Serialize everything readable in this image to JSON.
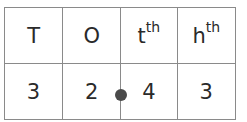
{
  "place_value_chart": {
    "headers": [
      {
        "label": "T",
        "sup": ""
      },
      {
        "label": "O",
        "sup": ""
      },
      {
        "label": "t",
        "sup": "th"
      },
      {
        "label": "h",
        "sup": "th"
      }
    ],
    "values": [
      "3",
      "2",
      "4",
      "3"
    ],
    "decimal_point": {
      "position_after_column": 1,
      "color": "#4a4a4a"
    },
    "border_color": "#8a8a8a"
  }
}
